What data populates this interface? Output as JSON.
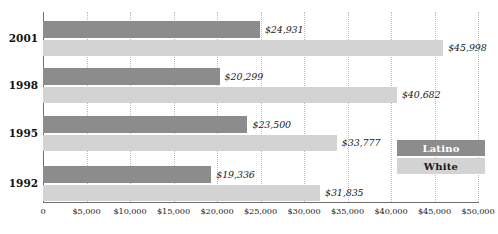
{
  "chart_data": {
    "type": "bar",
    "orientation": "horizontal",
    "title": "",
    "subtitle": "",
    "xlabel": "",
    "ylabel": "",
    "categories": [
      "2001",
      "1998",
      "1995",
      "1992"
    ],
    "series": [
      {
        "name": "Latino",
        "color": "#8c8c8c",
        "values": [
          24931,
          20299,
          23500,
          19336
        ],
        "labels": [
          "$24,931",
          "$20,299",
          "$23,500",
          "$19,336"
        ]
      },
      {
        "name": "White",
        "color": "#d3d3d3",
        "values": [
          45998,
          40682,
          33777,
          31835
        ],
        "labels": [
          "$45,998",
          "$40,682",
          "$33,777",
          "$31,835"
        ]
      }
    ],
    "xlim": [
      0,
      50000
    ],
    "xticks": [
      0,
      5000,
      10000,
      15000,
      20000,
      25000,
      30000,
      35000,
      40000,
      45000,
      50000
    ],
    "xticklabels": [
      "0",
      "$5,000",
      "$10,000",
      "$15,000",
      "$20,000",
      "$25,000",
      "$30,000",
      "$35,000",
      "$40,000",
      "$45,000",
      "$50,000"
    ],
    "grid": "vertical-dotted",
    "legend_position": "inside-right-lower"
  },
  "legend": {
    "items": [
      {
        "label": "Latino",
        "color": "#8c8c8c"
      },
      {
        "label": "White",
        "color": "#d3d3d3"
      }
    ]
  },
  "axis": {
    "line_color": "#6e6e6e",
    "grid_color": "#bdbdbd"
  }
}
